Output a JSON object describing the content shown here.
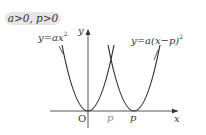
{
  "condition": "a>0, p>0",
  "curves": [
    {
      "label": "y=ax",
      "exponent": "2",
      "vertex": "O"
    },
    {
      "label": "y=a(x−p)",
      "exponent": "2",
      "vertex": "p"
    }
  ],
  "axes": {
    "x_label": "x",
    "y_label": "y",
    "origin_label": "O"
  },
  "ticks": {
    "p_gray": "p",
    "p_black": "p"
  },
  "colors": {
    "curve": "#333333",
    "axis": "#555555",
    "condition_bg": "#e6e6e6",
    "gray_label": "#888888"
  }
}
